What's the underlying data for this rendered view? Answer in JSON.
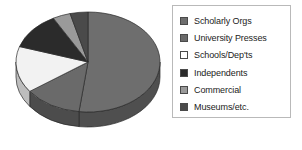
{
  "chart_data": {
    "type": "pie",
    "title": "",
    "three_d": true,
    "start_angle_deg": 0,
    "direction": "clockwise",
    "legend_position": "right",
    "legend_border": true,
    "categories": [
      "Scholarly Orgs",
      "University Presses",
      "Schools/Dep'ts",
      "Independents",
      "Commercial",
      "Museums/etc."
    ],
    "values": [
      52,
      13,
      15,
      12,
      4,
      4
    ],
    "unit": "percent",
    "colors": [
      "#6e6e6e",
      "#6a6a6a",
      "#f2f2f2",
      "#2b2b2b",
      "#9a9a9a",
      "#4a4a4a"
    ],
    "slices": [
      {
        "label": "Scholarly Orgs",
        "value": 52,
        "color": "#6e6e6e",
        "side_color": "#4f4f4f"
      },
      {
        "label": "University Presses",
        "value": 13,
        "color": "#6a6a6a",
        "side_color": "#4c4c4c"
      },
      {
        "label": "Schools/Dep'ts",
        "value": 15,
        "color": "#f2f2f2",
        "side_color": "#bdbdbd"
      },
      {
        "label": "Independents",
        "value": 12,
        "color": "#2b2b2b",
        "side_color": "#1d1d1d"
      },
      {
        "label": "Commercial",
        "value": 4,
        "color": "#9a9a9a",
        "side_color": "#6f6f6f"
      },
      {
        "label": "Museums/etc.",
        "value": 4,
        "color": "#4a4a4a",
        "side_color": "#343434"
      }
    ]
  },
  "legend": {
    "items": [
      {
        "label": "Scholarly Orgs",
        "color": "#6e6e6e"
      },
      {
        "label": "University Presses",
        "color": "#6a6a6a"
      },
      {
        "label": "Schools/Dep'ts",
        "color": "#ffffff"
      },
      {
        "label": "Independents",
        "color": "#2b2b2b"
      },
      {
        "label": "Commercial",
        "color": "#9a9a9a"
      },
      {
        "label": "Museums/etc.",
        "color": "#4a4a4a"
      }
    ]
  }
}
